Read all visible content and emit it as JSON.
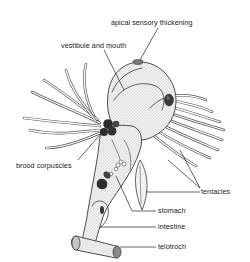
{
  "figure": {
    "labels": [
      {
        "id": "apical",
        "text": "apical sensory thickening",
        "x": 111,
        "y": 19
      },
      {
        "id": "vestibule",
        "text": "vestibule and mouth",
        "x": 61,
        "y": 42
      },
      {
        "id": "brood",
        "text": "brood corpuscles",
        "x": 16,
        "y": 162
      },
      {
        "id": "tentacles",
        "text": "tentacles",
        "x": 201,
        "y": 190
      },
      {
        "id": "stomach",
        "text": "stomach",
        "x": 158,
        "y": 209
      },
      {
        "id": "intestine",
        "text": "intestine",
        "x": 158,
        "y": 226
      },
      {
        "id": "telotroch",
        "text": "telotroch",
        "x": 158,
        "y": 246
      }
    ]
  },
  "colors": {
    "ink": "#3a3a3a",
    "stipple": "#e6e6e6",
    "dark": "#2a2a2a",
    "background": "#ffffff"
  }
}
